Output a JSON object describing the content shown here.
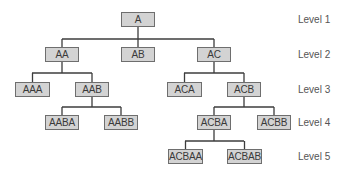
{
  "diagram": {
    "type": "tree",
    "style": {
      "node_fill": "#d3d3d3",
      "node_border": "#6e6e6e",
      "connector_color": "#3c3c3c",
      "text_color": "#3a3a3a"
    },
    "levels": [
      {
        "label": "Level 1",
        "y": 14
      },
      {
        "label": "Level 2",
        "y": 49
      },
      {
        "label": "Level 3",
        "y": 84
      },
      {
        "label": "Level 4",
        "y": 117
      },
      {
        "label": "Level 5",
        "y": 151
      }
    ],
    "nodes": [
      {
        "id": "A",
        "label": "A",
        "level": 1,
        "x": 121,
        "y": 12,
        "w": 34,
        "parent": null
      },
      {
        "id": "AA",
        "label": "AA",
        "level": 2,
        "x": 45,
        "y": 47,
        "w": 34,
        "parent": "A"
      },
      {
        "id": "AB",
        "label": "AB",
        "level": 2,
        "x": 121,
        "y": 47,
        "w": 34,
        "parent": "A"
      },
      {
        "id": "AC",
        "label": "AC",
        "level": 2,
        "x": 197,
        "y": 47,
        "w": 34,
        "parent": "A"
      },
      {
        "id": "AAA",
        "label": "AAA",
        "level": 3,
        "x": 15,
        "y": 82,
        "w": 35,
        "parent": "AA"
      },
      {
        "id": "AAB",
        "label": "AAB",
        "level": 3,
        "x": 75,
        "y": 82,
        "w": 34,
        "parent": "AA"
      },
      {
        "id": "ACA",
        "label": "ACA",
        "level": 3,
        "x": 167,
        "y": 82,
        "w": 35,
        "parent": "AC"
      },
      {
        "id": "ACB",
        "label": "ACB",
        "level": 3,
        "x": 227,
        "y": 82,
        "w": 34,
        "parent": "AC"
      },
      {
        "id": "AABA",
        "label": "AABA",
        "level": 4,
        "x": 45,
        "y": 115,
        "w": 34,
        "parent": "AAB"
      },
      {
        "id": "AABB",
        "label": "AABB",
        "level": 4,
        "x": 104,
        "y": 115,
        "w": 34,
        "parent": "AAB"
      },
      {
        "id": "ACBA",
        "label": "ACBA",
        "level": 4,
        "x": 197,
        "y": 115,
        "w": 34,
        "parent": "ACB"
      },
      {
        "id": "ACBB",
        "label": "ACBB",
        "level": 4,
        "x": 257,
        "y": 115,
        "w": 34,
        "parent": "ACB"
      },
      {
        "id": "ACBAA",
        "label": "ACBAA",
        "level": 5,
        "x": 168,
        "y": 149,
        "w": 35,
        "parent": "ACBA"
      },
      {
        "id": "ACBAB",
        "label": "ACBAB",
        "level": 5,
        "x": 227,
        "y": 149,
        "w": 35,
        "parent": "ACBA"
      }
    ],
    "connectors": [
      {
        "from": "A",
        "bus_y": 39,
        "x1": 62,
        "x2": 214
      },
      {
        "from": "AA",
        "bus_y": 73,
        "x1": 32,
        "x2": 92
      },
      {
        "from": "AC",
        "bus_y": 73,
        "x1": 184,
        "x2": 244
      },
      {
        "from": "AAB",
        "bus_y": 107,
        "x1": 62,
        "x2": 121
      },
      {
        "from": "ACB",
        "bus_y": 107,
        "x1": 214,
        "x2": 274
      },
      {
        "from": "ACBA",
        "bus_y": 141,
        "x1": 185,
        "x2": 244
      }
    ]
  }
}
